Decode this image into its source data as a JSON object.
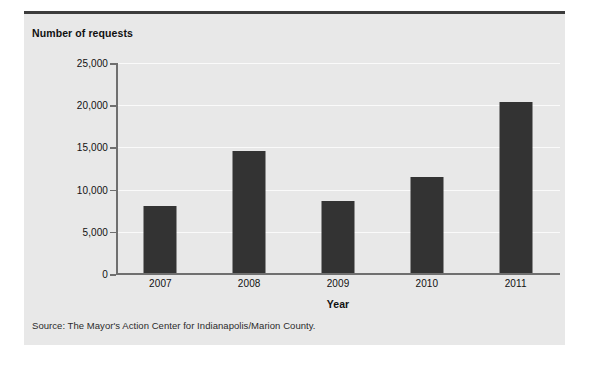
{
  "figure": {
    "cropped_header_text": "",
    "panel_background": "#e8e8e8",
    "rule_color": "#3c3c3c",
    "bar_color": "#333333",
    "axis_color": "#6f6f6f",
    "gridline_color": "#fafafa"
  },
  "source_note": "Source: The Mayor's Action Center for Indianapolis/Marion County.",
  "chart_data": {
    "type": "bar",
    "title": "",
    "categories": [
      "2007",
      "2008",
      "2009",
      "2010",
      "2011"
    ],
    "values": [
      8000,
      14600,
      8700,
      11500,
      20400
    ],
    "xlabel": "Year",
    "ylabel": "Number of requests",
    "ylim": [
      0,
      25000
    ],
    "yticks": [
      0,
      5000,
      10000,
      15000,
      20000,
      25000
    ],
    "ytick_labels": [
      "0",
      "5,000",
      "10,000",
      "15,000",
      "20,000",
      "25,000"
    ],
    "grid": true,
    "legend": false,
    "series": [
      {
        "name": "Number of requests",
        "values": [
          8000,
          14600,
          8700,
          11500,
          20400
        ]
      }
    ]
  }
}
